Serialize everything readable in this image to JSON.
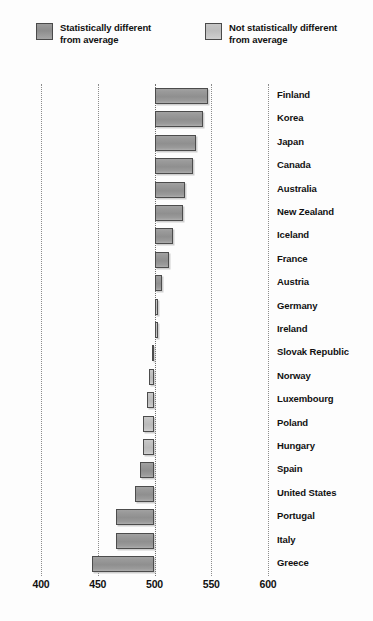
{
  "legend": {
    "items": [
      {
        "label": "Statistically different\nfrom average",
        "swatch": "dark-gray-swatch",
        "color": "#949494"
      },
      {
        "label": "Not statistically different\nfrom average",
        "swatch": "light-gray-swatch",
        "color": "#c2c2c2"
      }
    ]
  },
  "axis": {
    "ticks": [
      "400",
      "450",
      "500",
      "550",
      "600"
    ]
  },
  "chart_data": {
    "type": "bar",
    "orientation": "horizontal",
    "title": "",
    "subtitle": "",
    "xlabel": "",
    "ylabel": "",
    "xlim": [
      400,
      600
    ],
    "baseline": 500,
    "grid": true,
    "gridlines": [
      400,
      450,
      500,
      550,
      600
    ],
    "legend_position": "top",
    "categories": [
      "Finland",
      "Korea",
      "Japan",
      "Canada",
      "Australia",
      "New Zealand",
      "Iceland",
      "France",
      "Austria",
      "Germany",
      "Ireland",
      "Slovak Republic",
      "Norway",
      "Luxembourg",
      "Poland",
      "Hungary",
      "Spain",
      "United States",
      "Portugal",
      "Italy",
      "Greece"
    ],
    "values": [
      547,
      543,
      537,
      534,
      527,
      525,
      516,
      513,
      507,
      503,
      503,
      498,
      495,
      493,
      490,
      490,
      487,
      483,
      466,
      466,
      445
    ],
    "significance": [
      "different",
      "different",
      "different",
      "different",
      "different",
      "different",
      "different",
      "different",
      "different",
      "not-different",
      "not-different",
      "not-different",
      "not-different",
      "not-different",
      "not-different",
      "not-different",
      "different",
      "different",
      "different",
      "different",
      "different"
    ],
    "bars": [
      {
        "label": "Finland",
        "value": 547,
        "significance": "different"
      },
      {
        "label": "Korea",
        "value": 543,
        "significance": "different"
      },
      {
        "label": "Japan",
        "value": 537,
        "significance": "different"
      },
      {
        "label": "Canada",
        "value": 534,
        "significance": "different"
      },
      {
        "label": "Australia",
        "value": 527,
        "significance": "different"
      },
      {
        "label": "New Zealand",
        "value": 525,
        "significance": "different"
      },
      {
        "label": "Iceland",
        "value": 516,
        "significance": "different"
      },
      {
        "label": "France",
        "value": 513,
        "significance": "different"
      },
      {
        "label": "Austria",
        "value": 507,
        "significance": "different"
      },
      {
        "label": "Germany",
        "value": 503,
        "significance": "not-different"
      },
      {
        "label": "Ireland",
        "value": 503,
        "significance": "not-different"
      },
      {
        "label": "Slovak Republic",
        "value": 498,
        "significance": "not-different"
      },
      {
        "label": "Norway",
        "value": 495,
        "significance": "not-different"
      },
      {
        "label": "Luxembourg",
        "value": 493,
        "significance": "not-different"
      },
      {
        "label": "Poland",
        "value": 490,
        "significance": "not-different"
      },
      {
        "label": "Hungary",
        "value": 490,
        "significance": "not-different"
      },
      {
        "label": "Spain",
        "value": 487,
        "significance": "different"
      },
      {
        "label": "United States",
        "value": 483,
        "significance": "different"
      },
      {
        "label": "Portugal",
        "value": 466,
        "significance": "different"
      },
      {
        "label": "Italy",
        "value": 466,
        "significance": "different"
      },
      {
        "label": "Greece",
        "value": 445,
        "significance": "different"
      }
    ]
  }
}
